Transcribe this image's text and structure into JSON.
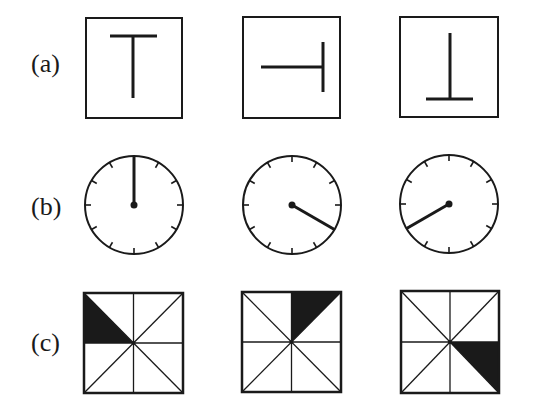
{
  "rows": [
    {
      "label": "(a)",
      "kind": "T-shape rotations",
      "panels": [
        {
          "orientation": "up",
          "rotation_deg": 0
        },
        {
          "orientation": "right",
          "rotation_deg": 90
        },
        {
          "orientation": "down",
          "rotation_deg": 180
        }
      ]
    },
    {
      "label": "(b)",
      "kind": "clock faces with single hand",
      "tick_count": 12,
      "panels": [
        {
          "hand_angle_deg": 0,
          "hand_position": "12 o'clock"
        },
        {
          "hand_angle_deg": 120,
          "hand_position": "4 o'clock"
        },
        {
          "hand_angle_deg": 240,
          "hand_position": "8 o'clock"
        }
      ]
    },
    {
      "label": "(c)",
      "kind": "square divided into 8 triangles with one shaded",
      "panels": [
        {
          "shaded_sector": "left-upper"
        },
        {
          "shaded_sector": "top-right"
        },
        {
          "shaded_sector": "right-lower"
        }
      ]
    }
  ],
  "colors": {
    "ink": "#1a1a1a",
    "background": "#ffffff"
  }
}
